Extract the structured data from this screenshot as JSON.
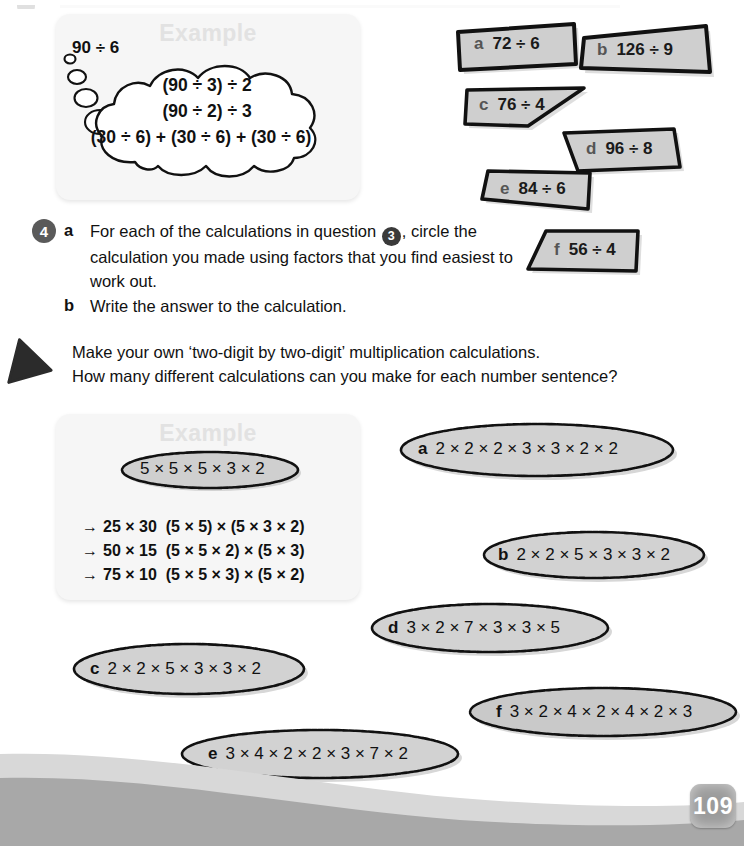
{
  "page": {
    "number": "109",
    "background_color": "#ffffff",
    "wave_colors": [
      "#d8d8d8",
      "#a8a8a8"
    ],
    "badge_color": "#9b9b9b"
  },
  "example_top": {
    "title": "Example",
    "lead_label": "90 ÷ 6",
    "bubble_lines": [
      "(90 ÷ 3) ÷ 2",
      "(90 ÷ 2) ÷ 3",
      "(30 ÷ 6) + (30 ÷ 6) + (30 ÷ 6)"
    ]
  },
  "shapes": [
    {
      "letter": "a",
      "calculation": "72 ÷ 6"
    },
    {
      "letter": "b",
      "calculation": "126 ÷ 9"
    },
    {
      "letter": "c",
      "calculation": "76 ÷ 4"
    },
    {
      "letter": "d",
      "calculation": "96 ÷ 8"
    },
    {
      "letter": "e",
      "calculation": "84 ÷ 6"
    },
    {
      "letter": "f",
      "calculation": "56 ÷ 4"
    }
  ],
  "question4": {
    "number": "4",
    "parts": [
      {
        "letter": "a",
        "text_before": "For each of the calculations in question",
        "ref_badge": "3",
        "text_after": ", circle the calculation you made using factors that you find easiest to work out."
      },
      {
        "letter": "b",
        "text": "Write the answer to the calculation."
      }
    ]
  },
  "activity": {
    "icon": "triangle-icon",
    "lines": [
      "Make your own ‘two-digit by two-digit’ multiplication calculations.",
      "How many different calculations can you make for each number sentence?"
    ]
  },
  "example_bottom": {
    "title": "Example",
    "oval_expression": "5 × 5 × 5 × 3 × 2",
    "lines": [
      {
        "arrow": "→",
        "product": "25 × 30",
        "factors": "(5 × 5) × (5 × 3 × 2)"
      },
      {
        "arrow": "→",
        "product": "50 × 15",
        "factors": "(5 × 5 × 2) × (5 × 3)"
      },
      {
        "arrow": "→",
        "product": "75 × 10",
        "factors": "(5 × 5 × 3) × (5 × 2)"
      }
    ]
  },
  "ovals": [
    {
      "letter": "a",
      "expression": "2 × 2 × 2 × 3 × 3 × 2 × 2"
    },
    {
      "letter": "b",
      "expression": "2 × 2 × 5 × 3 × 3 × 2"
    },
    {
      "letter": "c",
      "expression": "2 × 2 × 5 × 3 × 3 × 2"
    },
    {
      "letter": "d",
      "expression": "3 × 2 × 7 × 3 × 3 × 5"
    },
    {
      "letter": "e",
      "expression": "3 × 4 × 2 × 2 × 3 × 7 × 2"
    },
    {
      "letter": "f",
      "expression": "3 × 2 × 4 × 2 × 4 × 2 × 3"
    }
  ]
}
